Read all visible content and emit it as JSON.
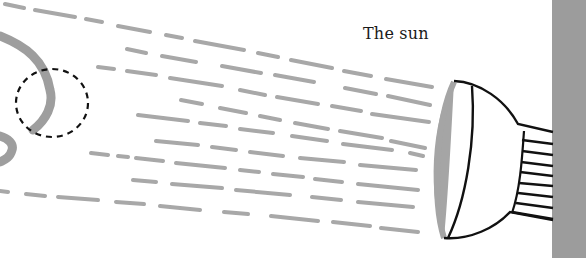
{
  "diagram": {
    "label": "The sun",
    "elements": {
      "sun": "lamp-shaped light source mounted on wall",
      "rays": "dashed gray light rays",
      "planet": "gray curved planet surface",
      "highlight": "dashed circle marking a region"
    },
    "colors": {
      "rays": "#a8a8a8",
      "wall": "#9c9c9c",
      "outline": "#111111",
      "planet": "#9e9e9e",
      "lens": "#a5a5a5"
    }
  }
}
